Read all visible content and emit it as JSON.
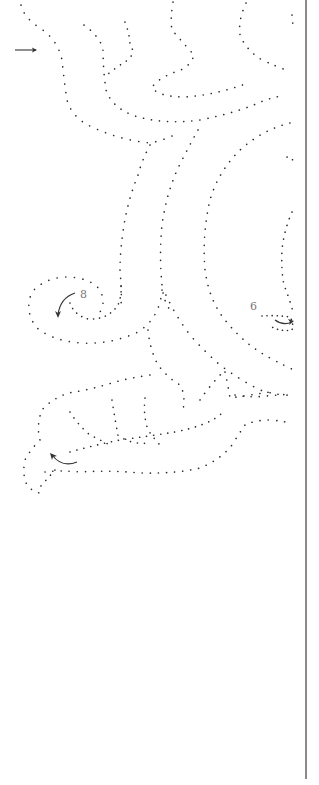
{
  "pattern": {
    "type": "pricked dot pattern",
    "dot_color": "#2a2a2a",
    "border_color": "#8a8a8a",
    "labels": [
      {
        "id": "step-8",
        "text": "8",
        "x": 80,
        "y": 289
      },
      {
        "id": "step-6",
        "text": "6",
        "x": 250,
        "y": 301
      }
    ],
    "arrows": [
      {
        "id": "start-arrow",
        "direction": "right",
        "x": 15,
        "y": 50
      },
      {
        "id": "spiral-arrow-8",
        "direction": "down-curve",
        "x": 58,
        "y": 293
      },
      {
        "id": "curl-arrow-6",
        "direction": "right-curve",
        "x": 275,
        "y": 323
      },
      {
        "id": "curl-arrow-bottom",
        "direction": "up-left-curve",
        "x": 52,
        "y": 455
      }
    ]
  }
}
